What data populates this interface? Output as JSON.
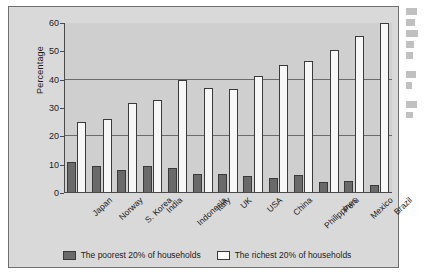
{
  "chart_data": {
    "type": "bar",
    "title": "",
    "xlabel": "",
    "ylabel": "Percentage",
    "ylim": [
      0,
      60
    ],
    "yticks": [
      0,
      10,
      20,
      30,
      40,
      50,
      60
    ],
    "gridlines": [
      20,
      40
    ],
    "grid": true,
    "legend_position": "bottom",
    "categories": [
      "Japan",
      "Norway",
      "S. Korea",
      "India",
      "Indonesia",
      "Italy",
      "UK",
      "USA",
      "China",
      "Philippines",
      "Peru",
      "Mexico",
      "Brazil"
    ],
    "series": [
      {
        "name": "The poorest 20% of households",
        "color": "#6a6a6a",
        "values": [
          10.9,
          9.6,
          8.2,
          9.5,
          9.0,
          6.7,
          6.8,
          6.0,
          5.3,
          6.2,
          3.8,
          4.2,
          3.0
        ]
      },
      {
        "name": "The richest 20% of households",
        "color": "#f7f7f7",
        "values": [
          25.1,
          26.0,
          31.7,
          32.7,
          39.8,
          37.2,
          36.7,
          41.4,
          45.1,
          46.7,
          50.5,
          55.4,
          60.0
        ]
      }
    ]
  },
  "legend": {
    "items": [
      {
        "label": "The poorest 20% of households",
        "swatch": "poor"
      },
      {
        "label": "The richest 20% of households",
        "swatch": "rich"
      }
    ]
  }
}
